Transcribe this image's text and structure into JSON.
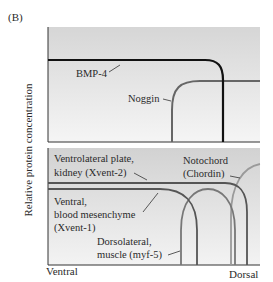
{
  "figure": {
    "panel_label": "(B)",
    "y_axis_label": "Relative protein concentration",
    "x_axis_left": "Ventral",
    "x_axis_right": "Dorsal"
  },
  "top_panel": {
    "curves": [
      {
        "name": "BMP-4",
        "label": "BMP-4",
        "color": "#111111"
      },
      {
        "name": "Noggin",
        "label": "Noggin",
        "color": "#666666"
      }
    ]
  },
  "bottom_panel": {
    "curves": [
      {
        "name": "Xvent-2",
        "label_line1": "Ventrolateral plate,",
        "label_line2": "kidney (Xvent-2)",
        "color": "#555555"
      },
      {
        "name": "Xvent-1",
        "label_line1": "Ventral,",
        "label_line2": "blood mesenchyme",
        "label_line3": "(Xvent-1)",
        "color": "#555555"
      },
      {
        "name": "myf-5",
        "label_line1": "Dorsolateral,",
        "label_line2": "muscle (myf-5)",
        "color": "#777777"
      },
      {
        "name": "Chordin",
        "label_line1": "Notochord",
        "label_line2": "(Chordin)",
        "color": "#999999"
      }
    ]
  },
  "colors": {
    "panel_top": "#d9d9d9",
    "panel_bottom": "#f4f4f4",
    "axis": "#333333"
  }
}
